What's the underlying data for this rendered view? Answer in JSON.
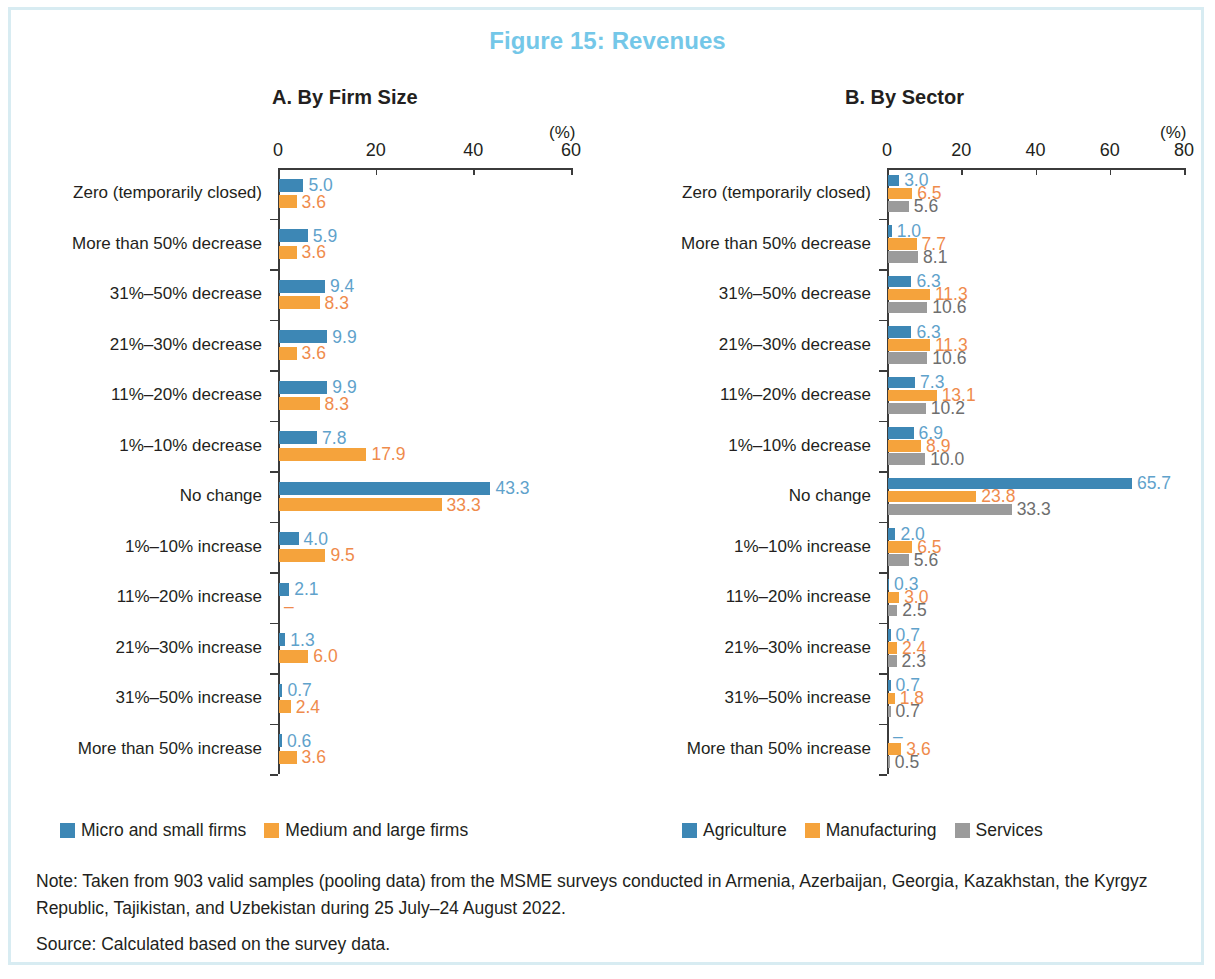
{
  "figure": {
    "title": "Figure 15: Revenues",
    "title_color": "#74c7e8",
    "border_color": "#d8ecf2"
  },
  "panel_a": {
    "title": "A. By Firm Size",
    "unit_label": "(%)"
  },
  "panel_b": {
    "title": "B. By Sector",
    "unit_label": "(%)"
  },
  "notes": {
    "note": "Note: Taken from 903 valid samples (pooling data) from the MSME surveys conducted in Armenia, Azerbaijan, Georgia, Kazakhstan, the Kyrgyz Republic, Tajikistan, and Uzbekistan during 25 July–24 August 2022.",
    "source": "Source: Calculated based on the survey data."
  },
  "chart_data": [
    {
      "id": "panel_a",
      "type": "bar",
      "orientation": "horizontal",
      "title": "A. By Firm Size",
      "xlabel": "(%)",
      "ylabel": "",
      "xlim": [
        0,
        60
      ],
      "xticks": [
        0,
        20,
        40,
        60
      ],
      "xticklabels": [
        "0",
        "20",
        "40",
        "60"
      ],
      "grid": false,
      "legend_position": "bottom-left",
      "categories": [
        "Zero (temporarily closed)",
        "More than 50% decrease",
        "31%–50% decrease",
        "21%–30% decrease",
        "11%–20% decrease",
        "1%–10% decrease",
        "No change",
        "1%–10% increase",
        "11%–20% increase",
        "21%–30% increase",
        "31%–50% increase",
        "More than 50% increase"
      ],
      "series": [
        {
          "name": "Micro and small firms",
          "color": "#3d87b5",
          "label_color": "#5fa2cb",
          "values": [
            5.0,
            5.9,
            9.4,
            9.9,
            9.9,
            7.8,
            43.3,
            4.0,
            2.1,
            1.3,
            0.7,
            0.6
          ],
          "labels": [
            "5.0",
            "5.9",
            "9.4",
            "9.9",
            "9.9",
            "7.8",
            "43.3",
            "4.0",
            "2.1",
            "1.3",
            "0.7",
            "0.6"
          ]
        },
        {
          "name": "Medium and large firms",
          "color": "#f5a33c",
          "label_color": "#ef8b4c",
          "values": [
            3.6,
            3.6,
            8.3,
            3.6,
            8.3,
            17.9,
            33.3,
            9.5,
            0,
            6.0,
            2.4,
            3.6
          ],
          "labels": [
            "3.6",
            "3.6",
            "8.3",
            "3.6",
            "8.3",
            "17.9",
            "33.3",
            "9.5",
            "–",
            "6.0",
            "2.4",
            "3.6"
          ]
        }
      ]
    },
    {
      "id": "panel_b",
      "type": "bar",
      "orientation": "horizontal",
      "title": "B. By Sector",
      "xlabel": "(%)",
      "ylabel": "",
      "xlim": [
        0,
        80
      ],
      "xticks": [
        0,
        20,
        40,
        60,
        80
      ],
      "xticklabels": [
        "0",
        "20",
        "40",
        "60",
        "80"
      ],
      "grid": false,
      "legend_position": "bottom-left",
      "categories": [
        "Zero (temporarily closed)",
        "More than 50% decrease",
        "31%–50% decrease",
        "21%–30% decrease",
        "11%–20% decrease",
        "1%–10% decrease",
        "No change",
        "1%–10% increase",
        "11%–20% increase",
        "21%–30% increase",
        "31%–50% increase",
        "More than 50% increase"
      ],
      "series": [
        {
          "name": "Agriculture",
          "color": "#3d87b5",
          "label_color": "#5fa2cb",
          "values": [
            3.0,
            1.0,
            6.3,
            6.3,
            7.3,
            6.9,
            65.7,
            2.0,
            0.3,
            0.7,
            0.7,
            0
          ],
          "labels": [
            "3.0",
            "1.0",
            "6.3",
            "6.3",
            "7.3",
            "6.9",
            "65.7",
            "2.0",
            "0.3",
            "0.7",
            "0.7",
            "–"
          ]
        },
        {
          "name": "Manufacturing",
          "color": "#f5a33c",
          "label_color": "#ef8b4c",
          "values": [
            6.5,
            7.7,
            11.3,
            11.3,
            13.1,
            8.9,
            23.8,
            6.5,
            3.0,
            2.4,
            1.8,
            3.6
          ],
          "labels": [
            "6.5",
            "7.7",
            "11.3",
            "11.3",
            "13.1",
            "8.9",
            "23.8",
            "6.5",
            "3.0",
            "2.4",
            "1.8",
            "3.6"
          ]
        },
        {
          "name": "Services",
          "color": "#9b9b9b",
          "label_color": "#6e6e6e",
          "values": [
            5.6,
            8.1,
            10.6,
            10.6,
            10.2,
            10.0,
            33.3,
            5.6,
            2.5,
            2.3,
            0.7,
            0.5
          ],
          "labels": [
            "5.6",
            "8.1",
            "10.6",
            "10.6",
            "10.2",
            "10.0",
            "33.3",
            "5.6",
            "2.5",
            "2.3",
            "0.7",
            "0.5"
          ]
        }
      ]
    }
  ]
}
